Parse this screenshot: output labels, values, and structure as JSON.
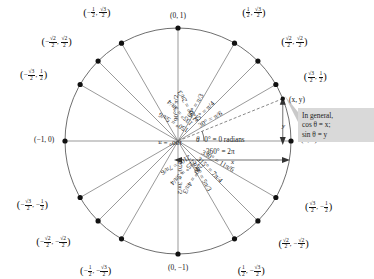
{
  "figure": {
    "center_labels": {
      "theta": "θ",
      "zero": "0° = 0 radians",
      "full_turn": "360° = 2π",
      "point_xy": "(x, y)",
      "x_arrow_label": "x",
      "y_arrow_label": "y"
    },
    "callout": {
      "line1": "In general,",
      "line2": "cos θ = x;",
      "line3": "sin θ = y",
      "background": "#d9d9d9"
    },
    "axis_points": [
      {
        "name": "right",
        "label": "(1, 0)"
      },
      {
        "name": "top",
        "label": "(0, 1)"
      },
      {
        "name": "left",
        "label": "(−1, 0)"
      },
      {
        "name": "bottom",
        "label": "(0, −1)"
      }
    ],
    "spokes": [
      {
        "deg": 0,
        "label": "0° = 0 radians"
      },
      {
        "deg": 30,
        "label": "30° = π/6"
      },
      {
        "deg": 45,
        "label": "45° = π/4"
      },
      {
        "deg": 60,
        "label": "60° = π/3"
      },
      {
        "deg": 90,
        "label": "90° = π/2"
      },
      {
        "deg": 120,
        "label": "120° = 2π/3"
      },
      {
        "deg": 135,
        "label": "135° = 3π/4"
      },
      {
        "deg": 150,
        "label": "150° = 5π/6"
      },
      {
        "deg": 180,
        "label": "180° = π"
      },
      {
        "deg": 210,
        "label": "210° = 7π/6"
      },
      {
        "deg": 225,
        "label": "225° = 5π/4"
      },
      {
        "deg": 240,
        "label": "240° = 4π/3"
      },
      {
        "deg": 270,
        "label": "270° = 3π/2"
      },
      {
        "deg": 300,
        "label": "300° = 5π/3"
      },
      {
        "deg": 315,
        "label": "315° = 7π/4"
      },
      {
        "deg": 330,
        "label": "330° = 11π/6"
      }
    ],
    "points": [
      {
        "deg": 30,
        "x": {
          "type": "frac",
          "num": "√3",
          "den": "2",
          "sign": ""
        },
        "y": {
          "type": "frac",
          "num": "1",
          "den": "2",
          "sign": ""
        }
      },
      {
        "deg": 45,
        "x": {
          "type": "frac",
          "num": "√2",
          "den": "2",
          "sign": ""
        },
        "y": {
          "type": "frac",
          "num": "√2",
          "den": "2",
          "sign": ""
        }
      },
      {
        "deg": 60,
        "x": {
          "type": "frac",
          "num": "1",
          "den": "2",
          "sign": ""
        },
        "y": {
          "type": "frac",
          "num": "√3",
          "den": "2",
          "sign": ""
        }
      },
      {
        "deg": 120,
        "x": {
          "type": "frac",
          "num": "1",
          "den": "2",
          "sign": "−"
        },
        "y": {
          "type": "frac",
          "num": "√3",
          "den": "2",
          "sign": ""
        }
      },
      {
        "deg": 135,
        "x": {
          "type": "frac",
          "num": "√2",
          "den": "2",
          "sign": "−"
        },
        "y": {
          "type": "frac",
          "num": "√2",
          "den": "2",
          "sign": ""
        }
      },
      {
        "deg": 150,
        "x": {
          "type": "frac",
          "num": "√3",
          "den": "2",
          "sign": "−"
        },
        "y": {
          "type": "frac",
          "num": "1",
          "den": "2",
          "sign": ""
        }
      },
      {
        "deg": 210,
        "x": {
          "type": "frac",
          "num": "√3",
          "den": "2",
          "sign": "−"
        },
        "y": {
          "type": "frac",
          "num": "1",
          "den": "2",
          "sign": "−"
        }
      },
      {
        "deg": 225,
        "x": {
          "type": "frac",
          "num": "√2",
          "den": "2",
          "sign": "−"
        },
        "y": {
          "type": "frac",
          "num": "√2",
          "den": "2",
          "sign": "−"
        }
      },
      {
        "deg": 240,
        "x": {
          "type": "frac",
          "num": "1",
          "den": "2",
          "sign": "−"
        },
        "y": {
          "type": "frac",
          "num": "√3",
          "den": "2",
          "sign": "−"
        }
      },
      {
        "deg": 300,
        "x": {
          "type": "frac",
          "num": "1",
          "den": "2",
          "sign": ""
        },
        "y": {
          "type": "frac",
          "num": "√3",
          "den": "2",
          "sign": "−"
        }
      },
      {
        "deg": 315,
        "x": {
          "type": "frac",
          "num": "√2",
          "den": "2",
          "sign": ""
        },
        "y": {
          "type": "frac",
          "num": "√2",
          "den": "2",
          "sign": "−"
        }
      },
      {
        "deg": 330,
        "x": {
          "type": "frac",
          "num": "√3",
          "den": "2",
          "sign": ""
        },
        "y": {
          "type": "frac",
          "num": "1",
          "den": "2",
          "sign": "−"
        }
      }
    ],
    "geometry": {
      "cx": 178,
      "cy": 141,
      "r": 113
    },
    "colors": {
      "stroke": "#6f6f6f",
      "dot": "#111111",
      "text": "#111111",
      "callout_bg": "#d9d9d9"
    }
  }
}
